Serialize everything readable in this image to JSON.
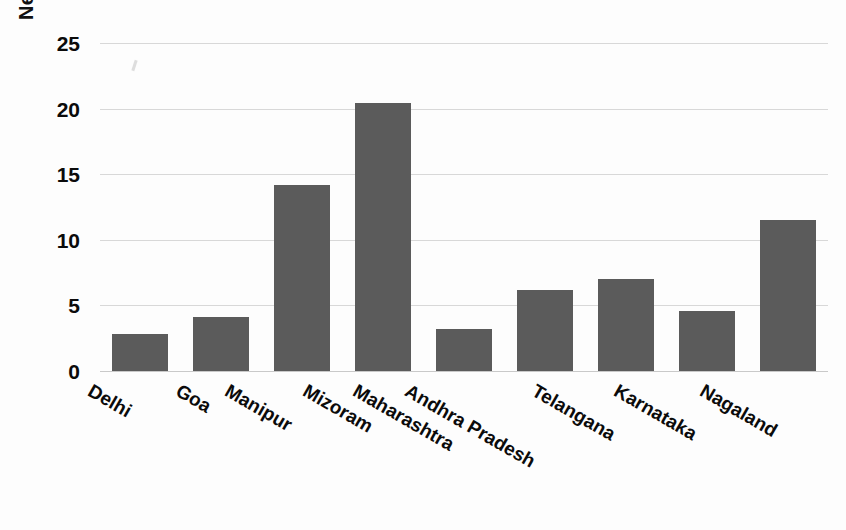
{
  "chart_data": {
    "type": "bar",
    "title": "",
    "xlabel": "",
    "ylabel": "New cases per 10000",
    "categories": [
      "Delhi",
      "Goa",
      "Manipur",
      "Mizoram",
      "Maharashtra",
      "Andhra Pradesh",
      "Telangana",
      "Karnataka",
      "Nagaland"
    ],
    "values": [
      2.8,
      4.1,
      14.2,
      20.4,
      3.2,
      6.2,
      7.0,
      4.6,
      11.5
    ],
    "ylim": [
      0,
      25
    ],
    "ytick_labels": [
      "0",
      "5",
      "10",
      "15",
      "20",
      "25"
    ],
    "ytick_values": [
      0,
      5,
      10,
      15,
      20,
      25
    ],
    "grid": true,
    "legend": "none",
    "bar_color": "#5b5b5b",
    "gridline_color": "#d8d8d8",
    "background_color": "#ffffff",
    "text_color": "#0b0b0b",
    "xtick_label_rotation": 30
  }
}
